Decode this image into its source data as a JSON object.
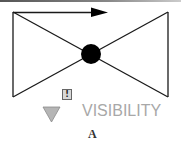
{
  "diagram": {
    "title_caption": "A",
    "visibility_label": "VISIBILITY",
    "warning_symbol": "!",
    "icons": {
      "arrow": "right-arrow-icon",
      "node": "filled-circle-node",
      "warning": "exclamation-box-icon",
      "triangle": "down-triangle-icon"
    },
    "colors": {
      "stroke": "#1a1a1a",
      "node_fill": "#000000",
      "triangle_fill": "#b5b5b5",
      "triangle_stroke": "#8a8a8a",
      "label": "#a8a8a8"
    }
  }
}
